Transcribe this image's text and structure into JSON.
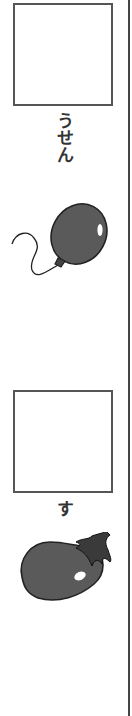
{
  "items": [
    {
      "answer_box": "",
      "hint_text": "うせん",
      "picture": "balloon-icon"
    },
    {
      "answer_box": "",
      "hint_text": "す",
      "picture": "eggplant-icon"
    }
  ],
  "colors": {
    "border": "#555555",
    "fill": "#5a5a5a",
    "text": "#333333"
  }
}
